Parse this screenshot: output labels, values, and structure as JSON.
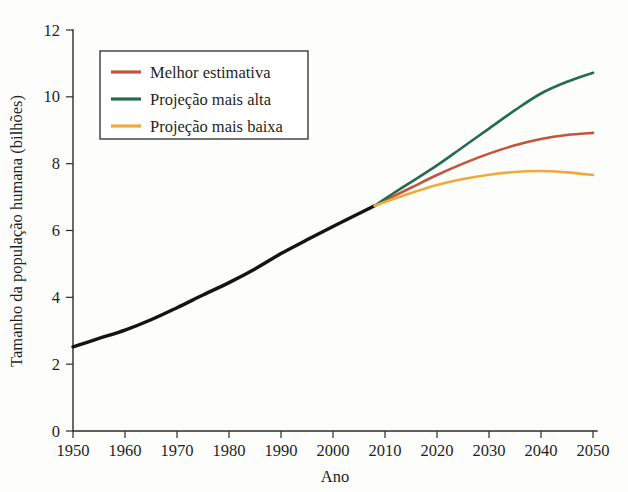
{
  "chart_data": {
    "type": "line",
    "title": "",
    "xlabel": "Ano",
    "ylabel": "Tamanho da população humana (bilhões)",
    "xlim": [
      1950,
      2050
    ],
    "ylim": [
      0,
      12
    ],
    "xticks": [
      1950,
      1960,
      1970,
      1980,
      1990,
      2000,
      2010,
      2020,
      2030,
      2040,
      2050
    ],
    "yticks": [
      0,
      2,
      4,
      6,
      8,
      10,
      12
    ],
    "grid": false,
    "legend_position": "upper-left",
    "colors": {
      "historical": "#141414",
      "best_estimate": "#C2553C",
      "highest_projection": "#256B4E",
      "lowest_projection": "#F0A93C"
    },
    "series": [
      {
        "name": "Histórico",
        "color": "#141414",
        "in_legend": false,
        "x": [
          1950,
          1955,
          1960,
          1965,
          1970,
          1975,
          1980,
          1985,
          1990,
          1995,
          2000,
          2005,
          2008
        ],
        "values": [
          2.52,
          2.77,
          3.02,
          3.33,
          3.69,
          4.07,
          4.44,
          4.85,
          5.31,
          5.72,
          6.12,
          6.51,
          6.74
        ]
      },
      {
        "name": "Melhor estimativa",
        "color": "#C2553C",
        "in_legend": true,
        "x": [
          2008,
          2010,
          2015,
          2020,
          2025,
          2030,
          2035,
          2040,
          2045,
          2050
        ],
        "values": [
          6.74,
          6.9,
          7.28,
          7.66,
          8.0,
          8.3,
          8.55,
          8.74,
          8.86,
          8.92
        ]
      },
      {
        "name": "Projeção mais alta",
        "color": "#256B4E",
        "in_legend": true,
        "x": [
          2008,
          2010,
          2015,
          2020,
          2025,
          2030,
          2035,
          2040,
          2045,
          2050
        ],
        "values": [
          6.74,
          6.95,
          7.45,
          7.95,
          8.5,
          9.05,
          9.6,
          10.1,
          10.45,
          10.72
        ]
      },
      {
        "name": "Projeção mais baixa",
        "color": "#F0A93C",
        "in_legend": true,
        "x": [
          2008,
          2010,
          2015,
          2020,
          2025,
          2030,
          2035,
          2040,
          2045,
          2050
        ],
        "values": [
          6.74,
          6.85,
          7.12,
          7.36,
          7.54,
          7.67,
          7.75,
          7.78,
          7.74,
          7.66
        ]
      }
    ]
  },
  "legend": {
    "items": [
      {
        "label": "Melhor estimativa",
        "color": "#C2553C"
      },
      {
        "label": "Projeção mais alta",
        "color": "#256B4E"
      },
      {
        "label": "Projeção mais baixa",
        "color": "#F0A93C"
      }
    ]
  },
  "axes": {
    "x_title": "Ano",
    "y_title": "Tamanho da população humana (bilhões)",
    "x_tick_labels": [
      "1950",
      "1960",
      "1970",
      "1980",
      "1990",
      "2000",
      "2010",
      "2020",
      "2030",
      "2040",
      "2050"
    ],
    "y_tick_labels": [
      "0",
      "2",
      "4",
      "6",
      "8",
      "10",
      "12"
    ]
  }
}
